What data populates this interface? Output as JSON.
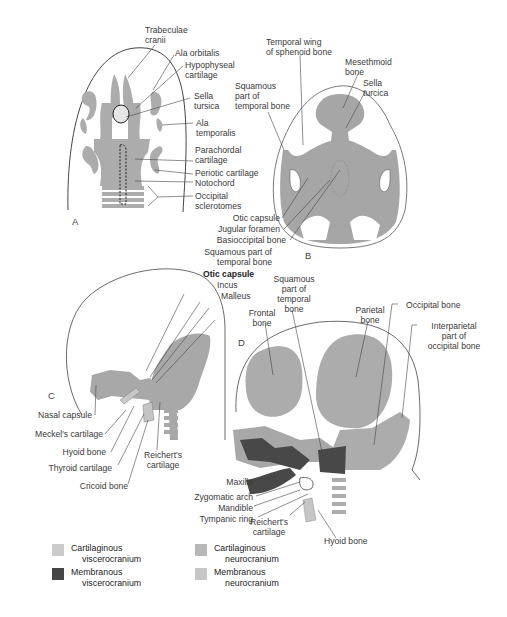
{
  "colors": {
    "cartilaginous_viscerocranium": "#c8c8c8",
    "membranous_viscerocranium": "#4a4a4a",
    "cartilaginous_neurocranium": "#b4b4b4",
    "membranous_neurocranium": "#c4c4c4",
    "bone_gray": "#a9a9a9",
    "outline": "#444444"
  },
  "panels": {
    "A": {
      "letter": "A",
      "labels": {
        "trabeculae_cranii": "Trabeculae\ncranii",
        "ala_orbitalis": "Ala orbitalis",
        "hypophyseal_cartilage": "Hypophyseal\ncartilage",
        "sella_tursica": "Sella\ntursica",
        "ala_temporalis": "Ala\ntemporalis",
        "parachordal_cartilage": "Parachordal\ncartilage",
        "periotic_cartilage": "Periotic cartilage",
        "notochord": "Notochord",
        "occipital_sclerotomes": "Occipital\nsclerotomes"
      }
    },
    "B": {
      "letter": "B",
      "labels": {
        "temporal_wing": "Temporal wing\nof sphenoid bone",
        "mesethmoid_bone": "Mesethmoid\nbone",
        "sella_turcica": "Sella\nturcica",
        "squamous_temporal": "Squamous\npart of\ntemporal bone",
        "otic_capsule": "Otic capsule",
        "jugular_foramen": "Jugular foramen",
        "basioccipital_bone": "Basioccipital bone"
      }
    },
    "C": {
      "letter": "C",
      "labels": {
        "squamous_temporal": "Squamous part of\ntemporal bone",
        "otic_capsule": "Otic capsule",
        "incus": "Incus",
        "malleus": "Malleus",
        "nasal_capsule": "Nasal capsule",
        "meckels_cartilage": "Meckel's cartilage",
        "hyoid_bone": "Hyoid bone",
        "thyroid_cartilage": "Thyroid cartilage",
        "cricoid_bone": "Cricoid bone",
        "reicherts_cartilage": "Reichert's\ncartilage"
      }
    },
    "D": {
      "letter": "D",
      "labels": {
        "squamous_temporal": "Squamous\npart of\ntemporal\nbone",
        "frontal_bone": "Frontal\nbone",
        "parietal_bone": "Parietal\nbone",
        "occipital_bone": "Occipital bone",
        "interparietal": "Interparietal\npart of\noccipital bone",
        "maxilla": "Maxilla",
        "zygomatic_arch": "Zygomatic arch",
        "mandible": "Mandible",
        "tympanic_ring": "Tympanic ring",
        "reicherts_cartilage": "Reichert's\ncartilage",
        "hyoid_bone": "Hyoid bone"
      }
    }
  },
  "legend": [
    {
      "line1": "Cartilaginous",
      "line2": "viscerocranium",
      "color": "#cbcbcb"
    },
    {
      "line1": "Membranous",
      "line2": "viscerocranium",
      "color": "#454545"
    },
    {
      "line1": "Cartilaginous",
      "line2": "neurocranium",
      "color": "#b8b8b8"
    },
    {
      "line1": "Membranous",
      "line2": "neurocranium",
      "color": "#c6c6c6"
    }
  ]
}
